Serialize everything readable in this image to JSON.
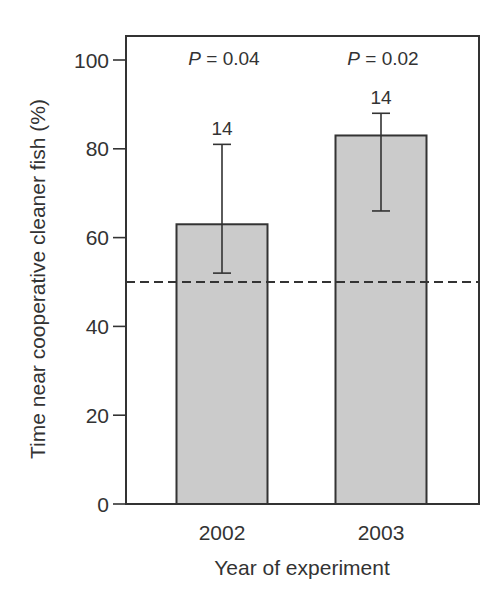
{
  "chart_data": {
    "type": "bar",
    "title": "",
    "xlabel": "Year of experiment",
    "ylabel": "Time near cooperative cleaner fish (%)",
    "categories": [
      "2002",
      "2003"
    ],
    "values": [
      63,
      83
    ],
    "error_bars": {
      "lower": [
        52,
        66
      ],
      "upper": [
        81,
        88
      ]
    },
    "sample_sizes": [
      "14",
      "14"
    ],
    "annotations": [
      {
        "category": "2002",
        "p_label": "P",
        "p_text": " = 0.04"
      },
      {
        "category": "2003",
        "p_label": "P",
        "p_text": " = 0.02"
      }
    ],
    "reference_line": {
      "y": 50,
      "style": "dashed"
    },
    "ylim": [
      0,
      100
    ],
    "yticks": [
      0,
      20,
      40,
      60,
      80,
      100
    ],
    "grid": false,
    "legend": null,
    "colors": {
      "bar_fill": "#cbcbcb",
      "bar_stroke": "#333333",
      "axis": "#333333",
      "text": "#333333"
    }
  }
}
